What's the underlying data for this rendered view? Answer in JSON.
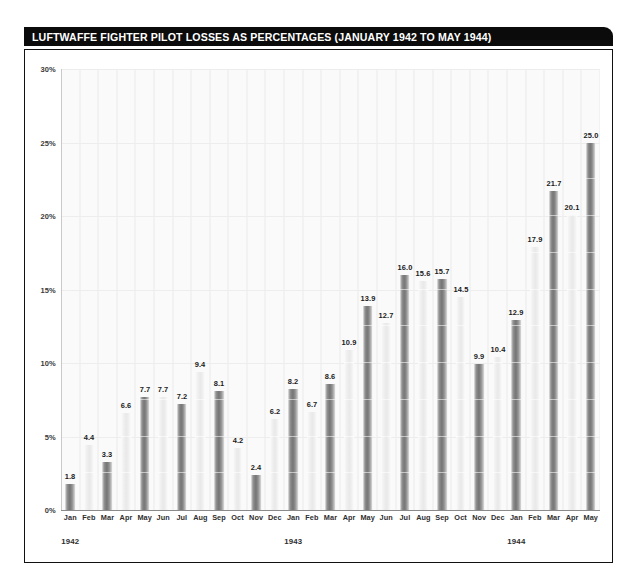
{
  "chart_data": {
    "type": "bar",
    "title": "LUFTWAFFE FIGHTER PILOT LOSSES AS PERCENTAGES (JANUARY 1942 TO MAY 1944)",
    "xlabel": "",
    "ylabel": "",
    "ylim": [
      0,
      30
    ],
    "ytick_labels": [
      "0%",
      "5%",
      "10%",
      "15%",
      "20%",
      "25%",
      "30%"
    ],
    "ytick_values": [
      0,
      5,
      10,
      15,
      20,
      25,
      30
    ],
    "grid": "horizontal-and-vertical-faint",
    "legend": "none",
    "value_label_format": "one-decimal",
    "categories": [
      "Jan",
      "Feb",
      "Mar",
      "Apr",
      "May",
      "Jun",
      "Jul",
      "Aug",
      "Sep",
      "Oct",
      "Nov",
      "Dec",
      "Jan",
      "Feb",
      "Mar",
      "Apr",
      "May",
      "Jun",
      "Jul",
      "Aug",
      "Sep",
      "Oct",
      "Nov",
      "Dec",
      "Jan",
      "Feb",
      "Mar",
      "Apr",
      "May"
    ],
    "values": [
      1.8,
      4.4,
      3.3,
      6.6,
      7.7,
      7.7,
      7.2,
      9.4,
      8.1,
      4.2,
      2.4,
      6.2,
      8.2,
      6.7,
      8.6,
      10.9,
      13.9,
      12.7,
      16.0,
      15.6,
      15.7,
      14.5,
      9.9,
      10.4,
      12.9,
      17.9,
      21.7,
      20.1,
      25.0
    ],
    "year_groups": [
      {
        "label": "1942",
        "start_index": 0,
        "end_index": 11
      },
      {
        "label": "1943",
        "start_index": 12,
        "end_index": 23
      },
      {
        "label": "1944",
        "start_index": 24,
        "end_index": 28
      }
    ],
    "bar_shading": "alternating dark and light",
    "colors": {
      "title_bar_background": "#0b0b0b",
      "title_text": "#ffffff",
      "bar_dark": "#7d7d7d",
      "bar_light": "#eeeeee",
      "frame_border": "#111111",
      "grid": "#ededed",
      "axis_text": "#2e2e2e",
      "page_background": "#ffffff"
    }
  }
}
